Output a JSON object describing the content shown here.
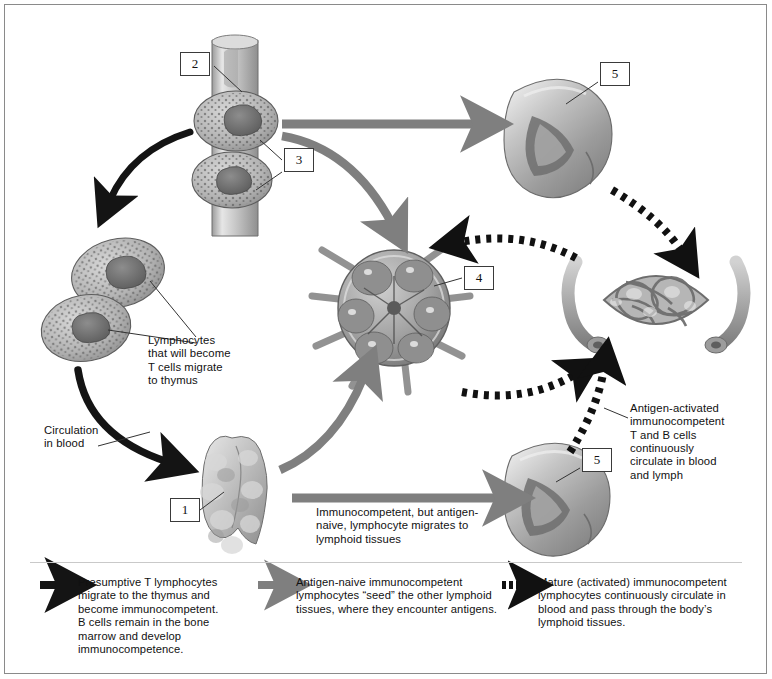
{
  "figure": {
    "background": "#ffffff",
    "border_color": "#8a8a8a"
  },
  "colors": {
    "black_arrow": "#141414",
    "gray_arrow": "#7f7f7f",
    "dashed_arrow": "#111111",
    "callout_border": "#3a3a3a",
    "leader_line": "#333333",
    "text": "#111111"
  },
  "callouts": [
    {
      "id": "callout-1",
      "number": "1",
      "target": "thymus"
    },
    {
      "id": "callout-2",
      "number": "2",
      "target": "bone-shaft"
    },
    {
      "id": "callout-3",
      "number": "3",
      "target": "bone-marrow-cells"
    },
    {
      "id": "callout-4",
      "number": "4",
      "target": "lymph-node"
    },
    {
      "id": "callout-5-top",
      "number": "5",
      "target": "spleen-upper"
    },
    {
      "id": "callout-5-bottom",
      "number": "5",
      "target": "spleen-lower"
    }
  ],
  "annotations": {
    "lymphocytes_to_thymus": "Lymphocytes\nthat will become\nT cells migrate\nto thymus",
    "circulation_in_blood": "Circulation\nin blood",
    "antigen_activated": "Antigen-activated\nimmunocompetent\nT and B cells\ncontinuously\ncirculate in blood\nand lymph",
    "immunocompetent_migration": "Immunocompetent, but antigen-\nnaive, lymphocyte migrates to\nlymphoid tissues"
  },
  "legend": {
    "items": [
      {
        "arrow_style": "solid-black",
        "text": "Presumptive T lymphocytes\nmigrate to the thymus and\nbecome immunocompetent.\nB cells remain in the bone\nmarrow and develop\nimmunocompetence."
      },
      {
        "arrow_style": "solid-gray",
        "text": "Antigen-naive immunocompetent\nlymphocytes “seed” the other lymphoid\ntissues, where they encounter antigens."
      },
      {
        "arrow_style": "dashed-black",
        "text": "Mature (activated) immunocompetent\nlymphocytes continuously circulate in\nblood and pass through the body’s\nlymphoid tissues."
      }
    ]
  },
  "structures": [
    {
      "name": "bone-with-marrow",
      "label": "bone and marrow cells"
    },
    {
      "name": "lymphocyte-pair",
      "label": "lymphocytes"
    },
    {
      "name": "thymus",
      "label": "thymus"
    },
    {
      "name": "lymph-node",
      "label": "lymph node"
    },
    {
      "name": "spleen-upper",
      "label": "spleen"
    },
    {
      "name": "spleen-lower",
      "label": "spleen"
    },
    {
      "name": "capillary-bed",
      "label": "lymphoid capillary bed"
    }
  ]
}
